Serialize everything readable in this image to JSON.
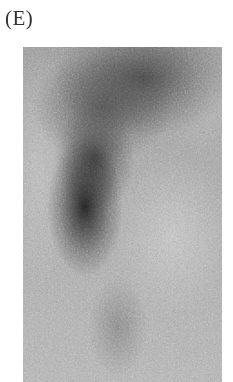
{
  "figure": {
    "panel_label": "(E)",
    "image_description": "grayscale scintigraphy-style scan with dark curved uptake region",
    "colors": {
      "background": "#ffffff",
      "scan_mid_gray": "#a9a9a9",
      "dark_region": "#232323",
      "label_text": "#333333"
    }
  }
}
